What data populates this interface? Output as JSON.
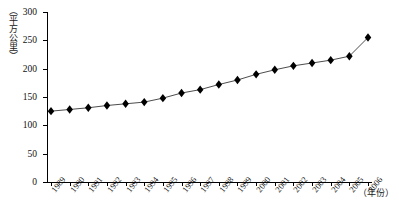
{
  "chart_data": {
    "type": "line",
    "title": "",
    "xlabel": "（年份）",
    "ylabel": "（平方公里）",
    "grid": false,
    "legend": "none",
    "marker": "diamond",
    "xlim": [
      1989,
      2006
    ],
    "ylim": [
      0,
      300
    ],
    "ytick_step": 50,
    "yticks": [
      300,
      250,
      200,
      150,
      100,
      50,
      0
    ],
    "categories": [
      "1989",
      "1990",
      "1991",
      "1992",
      "1993",
      "1994",
      "1995",
      "1996",
      "1997",
      "1998",
      "1999",
      "2000",
      "2001",
      "2002",
      "2003",
      "2004",
      "2005",
      "2006"
    ],
    "values": [
      125,
      128,
      131,
      135,
      138,
      141,
      148,
      157,
      163,
      172,
      180,
      190,
      198,
      205,
      210,
      215,
      222,
      255
    ],
    "series": [
      {
        "name": "",
        "values": [
          125,
          128,
          131,
          135,
          138,
          141,
          148,
          157,
          163,
          172,
          180,
          190,
          198,
          205,
          210,
          215,
          222,
          255
        ]
      }
    ]
  },
  "colors": {
    "axis": "#000000",
    "line": "#4d4d4d",
    "marker": "#000000",
    "text": "#111111",
    "background": "#ffffff"
  }
}
